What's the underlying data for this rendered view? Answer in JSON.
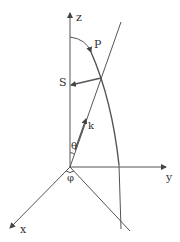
{
  "diagram": {
    "type": "3d-coordinate-system",
    "stroke_color": "#555555",
    "labels": {
      "z_axis": "z",
      "y_axis": "y",
      "x_axis": "x",
      "point_p": "P",
      "point_s": "S",
      "vector_k": "k",
      "angle_theta": "θ",
      "angle_phi": "φ"
    }
  }
}
